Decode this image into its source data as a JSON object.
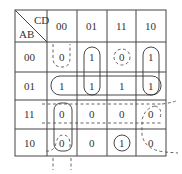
{
  "kmap": {
    "corner": {
      "top_right": "CD",
      "bottom_left": "AB"
    },
    "col_headers": [
      "00",
      "01",
      "11",
      "10"
    ],
    "row_headers": [
      "00",
      "01",
      "11",
      "10"
    ],
    "cells": [
      [
        "0",
        "1",
        "0",
        "1"
      ],
      [
        "1",
        "1",
        "1",
        "1"
      ],
      [
        "0",
        "0",
        "0",
        "0"
      ],
      [
        "0",
        "0",
        "1",
        "0"
      ]
    ],
    "groupings": {
      "solid": [
        "col-01 rows 00-01",
        "col-10 rows 00-01",
        "row-01 all columns",
        "col-00 rows 11-10",
        "cell 10/11"
      ],
      "dashed": [
        "col-00 row-00 (wrapping from top)",
        "cell 00/11",
        "row-11 all columns (wrapping)",
        "cell 10/00 (wrapping down)",
        "col-10 rows 11-10 (wrapping right)"
      ]
    }
  }
}
